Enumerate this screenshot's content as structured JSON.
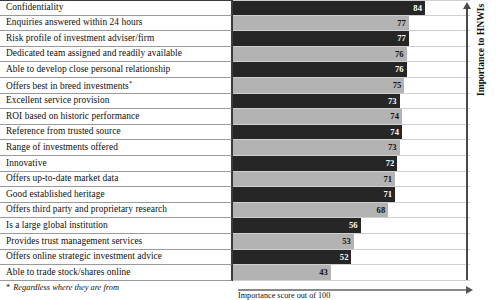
{
  "chart_data": {
    "type": "bar",
    "orientation": "horizontal",
    "title": "",
    "xlabel": "Importance score out of 100",
    "ylabel": "Importance to HNWIs",
    "xlim": [
      0,
      100
    ],
    "grid": true,
    "legend": "none",
    "value_labels": true,
    "colors": {
      "dark_bar": "#262626",
      "light_bar": "#b3b3b3",
      "dark_value_text": "#ffffff",
      "light_value_text": "#111111",
      "rule": "#9a9a9a",
      "axis": "#4a4a4a"
    },
    "categories": [
      "Confidentiality",
      "Enquiries answered within 24 hours",
      "Risk profile of investment adviser/firm",
      "Dedicated team assigned and readily available",
      "Able to develop close personal relationship",
      "Offers best in breed investments*",
      "Excellent service provision",
      "ROI based on historic performance",
      "Reference from trusted source",
      "Range of investments offered",
      "Innovative",
      "Offers up-to-date market data",
      "Good established heritage",
      "Offers third party and proprietary research",
      "Is a large global institution",
      "Provides trust management services",
      "Offers online strategic investment advice",
      "Able to trade stock/shares online"
    ],
    "values": [
      84,
      77,
      77,
      76,
      76,
      75,
      73,
      74,
      74,
      73,
      72,
      71,
      71,
      68,
      56,
      53,
      52,
      43
    ]
  },
  "rows": [
    {
      "label": "Confidentiality",
      "value": 84,
      "shade": "dark"
    },
    {
      "label": "Enquiries answered within 24 hours",
      "value": 77,
      "shade": "light"
    },
    {
      "label": "Risk profile of investment adviser/firm",
      "value": 77,
      "shade": "dark"
    },
    {
      "label": "Dedicated team assigned and readily available",
      "value": 76,
      "shade": "light"
    },
    {
      "label": "Able to develop close personal relationship",
      "value": 76,
      "shade": "dark"
    },
    {
      "label": "Offers best in breed investments*",
      "value": 75,
      "shade": "light"
    },
    {
      "label": "Excellent service provision",
      "value": 73,
      "shade": "dark"
    },
    {
      "label": "ROI based on historic performance",
      "value": 74,
      "shade": "light"
    },
    {
      "label": "Reference from trusted source",
      "value": 74,
      "shade": "dark"
    },
    {
      "label": "Range of investments offered",
      "value": 73,
      "shade": "light"
    },
    {
      "label": "Innovative",
      "value": 72,
      "shade": "dark"
    },
    {
      "label": "Offers up-to-date market data",
      "value": 71,
      "shade": "light"
    },
    {
      "label": "Good established heritage",
      "value": 71,
      "shade": "dark"
    },
    {
      "label": "Offers third party and proprietary research",
      "value": 68,
      "shade": "light"
    },
    {
      "label": "Is a large global institution",
      "value": 56,
      "shade": "dark"
    },
    {
      "label": "Provides trust management services",
      "value": 53,
      "shade": "light"
    },
    {
      "label": "Offers online strategic investment advice",
      "value": 52,
      "shade": "dark"
    },
    {
      "label": "Able to trade stock/shares online",
      "value": 43,
      "shade": "light"
    }
  ],
  "axes": {
    "vertical_label": "Importance to HNWIs",
    "horizontal_label": "Importance score out of 100"
  },
  "footnote": {
    "marker": "*",
    "text": "Regardless where they are from"
  }
}
